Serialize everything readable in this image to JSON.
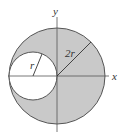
{
  "diagram": {
    "axes": {
      "x_label": "x",
      "y_label": "y"
    },
    "large_circle": {
      "radius_label": "2r",
      "fill": "#c9c9c9",
      "stroke": "#555555"
    },
    "small_circle": {
      "radius_label": "r",
      "fill": "#ffffff",
      "stroke": "#555555"
    },
    "relationship": "Small circle of radius r is internally tangent to large circle of radius 2r centered at the origin; region between them is shaded"
  }
}
